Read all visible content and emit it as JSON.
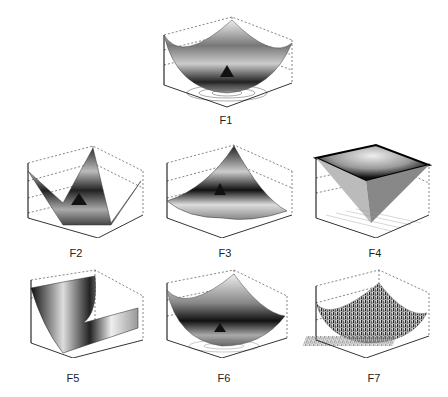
{
  "figure": {
    "panels": [
      {
        "id": "F1",
        "label": "F1",
        "shape": "bowl",
        "zscale": "x 10^4"
      },
      {
        "id": "F2",
        "label": "F2",
        "shape": "pyramid-corners",
        "zscale": ""
      },
      {
        "id": "F3",
        "label": "F3",
        "shape": "tilted-corner",
        "zscale": "x 10^4"
      },
      {
        "id": "F4",
        "label": "F4",
        "shape": "inverted-pyramid",
        "zscale": ""
      },
      {
        "id": "F5",
        "label": "F5",
        "shape": "valley",
        "zscale": "x 10^4"
      },
      {
        "id": "F6",
        "label": "F6",
        "shape": "bowl",
        "zscale": "x 10^4"
      },
      {
        "id": "F7",
        "label": "F7",
        "shape": "noisy-bowl",
        "zscale": ""
      }
    ],
    "axis_ticks": [
      "-100",
      "-50",
      "0",
      "50",
      "100"
    ],
    "caption": ""
  }
}
